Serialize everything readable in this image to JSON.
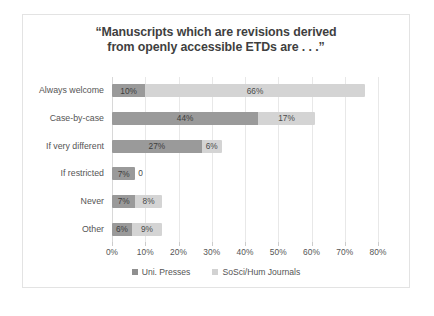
{
  "chart_data": {
    "type": "bar",
    "orientation": "horizontal",
    "stacked": true,
    "title": "“Manuscripts which are revisions derived from openly accessible ETDs are . . .”",
    "title_line1": "“Manuscripts which are revisions derived",
    "title_line2": "from openly accessible ETDs are . . .”",
    "xlabel": "",
    "ylabel": "",
    "xlim": [
      0,
      80
    ],
    "xticks": [
      "0%",
      "10%",
      "20%",
      "30%",
      "40%",
      "50%",
      "60%",
      "70%",
      "80%"
    ],
    "grid": true,
    "legend_position": "bottom",
    "categories": [
      "Always welcome",
      "Case-by-case",
      "If very different",
      "If restricted",
      "Never",
      "Other"
    ],
    "series": [
      {
        "name": "Uni. Presses",
        "color": "#9a9a9a",
        "values": [
          10,
          44,
          27,
          7,
          7,
          6
        ],
        "labels": [
          "10%",
          "44%",
          "27%",
          "7%",
          "7%",
          "6%"
        ]
      },
      {
        "name": "SoSci/Hum Journals",
        "color": "#d4d4d4",
        "values": [
          66,
          17,
          6,
          0,
          8,
          9
        ],
        "labels": [
          "66%",
          "17%",
          "6%",
          "0",
          "8%",
          "9%"
        ]
      }
    ]
  },
  "colors": {
    "series_1": "#9a9a9a",
    "series_2": "#d4d4d4",
    "border": "#e3e3e3",
    "text": "#555555",
    "title_text": "#3f3f3f",
    "gridline": "#e8e8e8"
  }
}
